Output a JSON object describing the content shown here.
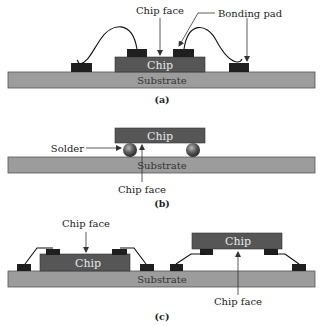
{
  "diagram": {
    "panels": [
      {
        "id": "a",
        "caption": "(a)",
        "title": "Wire bonding",
        "labels": {
          "chip": "Chip",
          "substrate": "Substrate",
          "chip_face": "Chip face",
          "bonding_pad": "Bonding pad"
        }
      },
      {
        "id": "b",
        "caption": "(b)",
        "title": "Flip chip",
        "labels": {
          "chip": "Chip",
          "substrate": "Substrate",
          "solder": "Solder",
          "chip_face": "Chip face"
        }
      },
      {
        "id": "c",
        "caption": "(c)",
        "title": "Tape automated bonding",
        "labels": {
          "chip_left": "Chip",
          "chip_right": "Chip",
          "substrate": "Substrate",
          "chip_face_top": "Chip face",
          "chip_face_bottom": "Chip face"
        }
      }
    ],
    "colors": {
      "substrate": "#9c9c9c",
      "chip": "#565656",
      "pad": "#1f1f1f",
      "solder": "#6a6a6a",
      "text": "#222222"
    }
  }
}
